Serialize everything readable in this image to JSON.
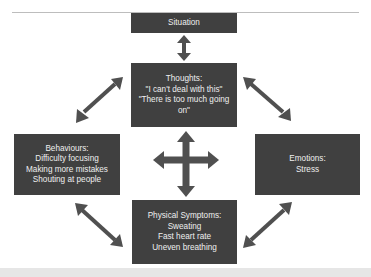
{
  "diagram": {
    "type": "cbt-cycle",
    "box_color": "#404040",
    "text_color": "#efefef",
    "arrow_color": "#505050",
    "nodes": {
      "situation": {
        "lines": [
          "Situation"
        ]
      },
      "thoughts": {
        "lines": [
          "Thoughts:",
          "\"I can't deal with this\"",
          "\"There is too much going",
          "on\""
        ]
      },
      "behaviours": {
        "lines": [
          "Behaviours:",
          "Difficulty focusing",
          "Making more mistakes",
          "Shouting at people"
        ]
      },
      "emotions": {
        "lines": [
          "Emotions:",
          "Stress"
        ]
      },
      "physical": {
        "lines": [
          "Physical Symptoms:",
          "Sweating",
          "Fast heart rate",
          "Uneven breathing"
        ]
      }
    },
    "edges": [
      {
        "from": "situation",
        "to": "thoughts",
        "style": "double-arrow"
      },
      {
        "from": "thoughts",
        "to": "behaviours",
        "style": "double-arrow"
      },
      {
        "from": "thoughts",
        "to": "emotions",
        "style": "double-arrow"
      },
      {
        "from": "behaviours",
        "to": "physical",
        "style": "double-arrow"
      },
      {
        "from": "emotions",
        "to": "physical",
        "style": "double-arrow"
      },
      {
        "center": "four-way-arrow",
        "connects": [
          "thoughts",
          "physical",
          "behaviours",
          "emotions"
        ]
      }
    ]
  }
}
